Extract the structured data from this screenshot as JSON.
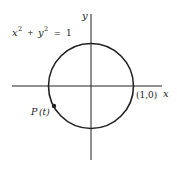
{
  "diagram": {
    "equation": {
      "x_part": "x",
      "x_exp": "2",
      "plus": "+",
      "y_part": "y",
      "y_exp": "2",
      "equals": "=",
      "rhs": "1"
    },
    "axes": {
      "x_label": "x",
      "y_label": "y"
    },
    "point_label": "(1,0)",
    "p_label": "P",
    "p_arg": "(t)",
    "colors": {
      "stroke": "#222222",
      "background": "#ffffff"
    }
  }
}
